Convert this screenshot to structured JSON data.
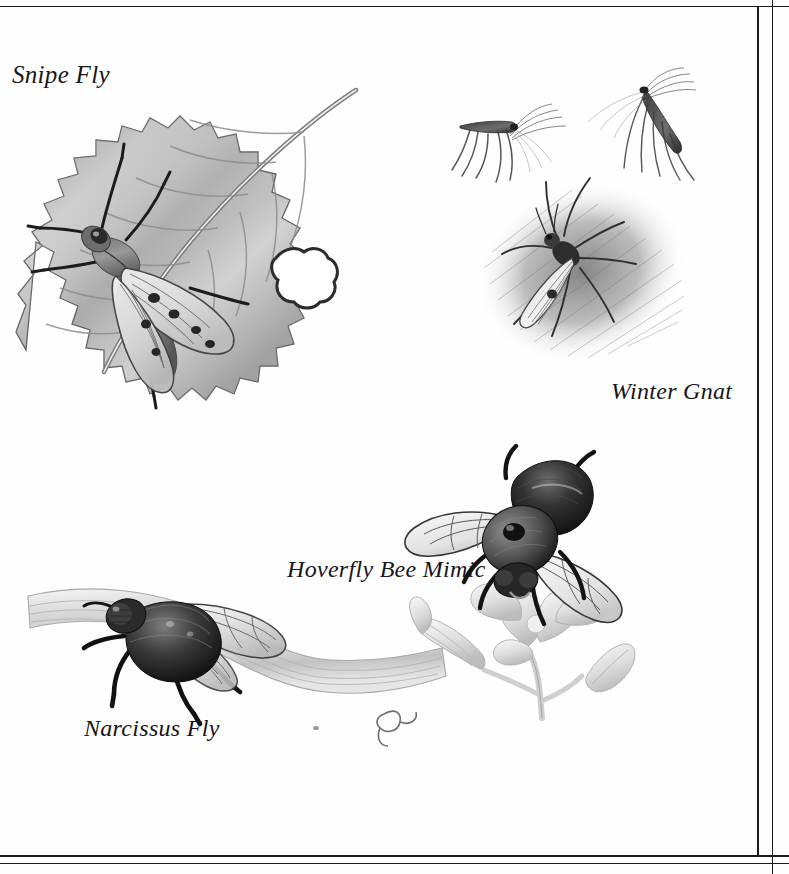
{
  "page": {
    "background_color": "#fefefe",
    "ink_color": "#17161a",
    "rule_color": "#1b1b1b",
    "medium": "grayscale pencil illustration plate"
  },
  "frame": {
    "top_rule": "horizontal-rule-top",
    "bottom_rule_outer": "horizontal-rule-bottom-outer",
    "bottom_rule_inner": "horizontal-rule-bottom-inner",
    "right_rule_inner": "vertical-rule-right-inner",
    "right_rule_outer": "vertical-rule-right-outer"
  },
  "figures": [
    {
      "id": "snipe-fly",
      "caption": "Snipe Fly",
      "subject": "snipe fly resting on a serrated leaf with a chewed hole",
      "elements": [
        "serrated leaf",
        "leaf midrib",
        "chewed hole",
        "patterned wings",
        "long dark legs",
        "large compound eye"
      ]
    },
    {
      "id": "winter-gnat",
      "caption": "Winter Gnat",
      "subject": "three winter gnats, two in flight above a large one resting on a shaded patch",
      "elements": [
        "flying gnat left",
        "flying gnat right",
        "resting gnat",
        "hatched shadow patch",
        "trailing legs",
        "plumed antennae"
      ]
    },
    {
      "id": "hoverfly-bee-mimic",
      "caption": "Hoverfly Bee Mimic",
      "subject": "furry bee-mimicking hoverfly feeding on a pale flower cluster",
      "elements": [
        "furry thorax",
        "dark abdomen",
        "veined wings",
        "open blossom",
        "tubular flower",
        "closed bud",
        "flower stem"
      ]
    },
    {
      "id": "narcissus-fly",
      "caption": "Narcissus Fly",
      "subject": "narcissus fly perched on a bent daffodil leaf with a withered tip",
      "elements": [
        "furry body",
        "veined wing",
        "bent leaf blade",
        "withered leaf tip",
        "dark legs"
      ]
    }
  ]
}
